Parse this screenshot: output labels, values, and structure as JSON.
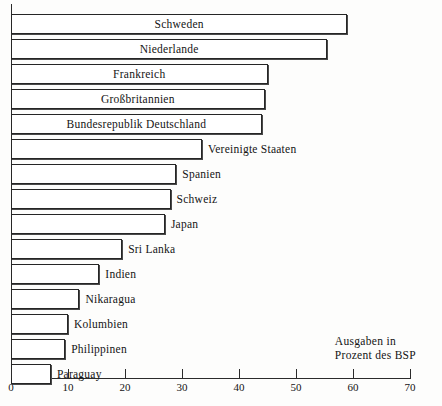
{
  "chart_data": {
    "type": "bar",
    "orientation": "horizontal",
    "title": "",
    "subtitle": "",
    "xlabel": "Ausgaben in Prozent des BSP",
    "ylabel": "",
    "xlim": [
      0,
      70
    ],
    "grid": false,
    "legend": null,
    "xticks": [
      "0",
      "10",
      "20",
      "30",
      "40",
      "50",
      "60",
      "70"
    ],
    "xtick_values": [
      0,
      10,
      20,
      30,
      40,
      50,
      60,
      70
    ],
    "categories": [
      "Schweden",
      "Niederlande",
      "Frankreich",
      "Großbritannien",
      "Bundesrepublik Deutschland",
      "Vereinigte Staaten",
      "Spanien",
      "Schweiz",
      "Japan",
      "Sri Lanka",
      "Indien",
      "Nikaragua",
      "Kolumbien",
      "Philippinen",
      "Paraguay"
    ],
    "values": [
      59,
      55.5,
      45,
      44.5,
      44,
      33.5,
      29,
      28,
      27,
      19.5,
      15.5,
      12,
      10,
      9.5,
      7
    ],
    "label_placement": [
      "inside",
      "inside",
      "inside",
      "inside",
      "inside",
      "outside",
      "outside",
      "outside",
      "outside",
      "outside",
      "outside",
      "outside",
      "outside",
      "outside",
      "outside"
    ]
  },
  "annotation": {
    "line1": "Ausgaben in",
    "line2": "Prozent des BSP"
  },
  "colors": {
    "bar_fill": "#ffffff",
    "bar_stroke": "#262626",
    "axis": "#2b2b2b",
    "text": "#141414",
    "background": "#fdfdfc"
  }
}
